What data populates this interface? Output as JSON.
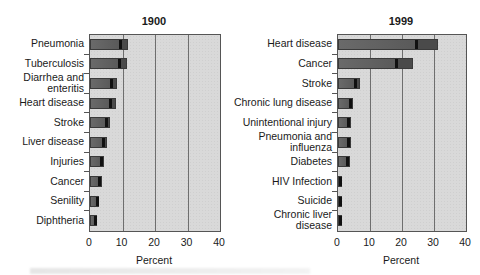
{
  "chart_data": [
    {
      "type": "bar",
      "orientation": "horizontal",
      "title": "1900",
      "xlabel": "Percent",
      "ylabel": "",
      "xlim": [
        0,
        40
      ],
      "xticks": [
        "0",
        "10",
        "20",
        "30",
        "40"
      ],
      "grid": true,
      "categories": [
        "Pneumonia",
        "Tuberculosis",
        "Diarrhea and enteritis",
        "Heart disease",
        "Stroke",
        "Liver disease",
        "Injuries",
        "Cancer",
        "Senility",
        "Diphtheria"
      ],
      "values": [
        11.8,
        11.3,
        8.3,
        8.0,
        6.2,
        5.2,
        4.2,
        3.7,
        2.9,
        2.3
      ]
    },
    {
      "type": "bar",
      "orientation": "horizontal",
      "title": "1999",
      "xlabel": "Percent",
      "ylabel": "",
      "xlim": [
        0,
        40
      ],
      "xticks": [
        "0",
        "10",
        "20",
        "30",
        "40"
      ],
      "grid": true,
      "categories": [
        "Heart disease",
        "Cancer",
        "Stroke",
        "Chronic lung disease",
        "Unintentional injury",
        "Pneumonia and influenza",
        "Diabetes",
        "HIV Infection",
        "Suicide",
        "Chronic liver disease"
      ],
      "values": [
        31.2,
        23.4,
        6.9,
        4.8,
        4.2,
        4.0,
        3.6,
        1.2,
        1.4,
        1.3
      ]
    }
  ],
  "left": {
    "title": "1900",
    "xlabel": "Percent",
    "ticks": [
      "0",
      "10",
      "20",
      "30",
      "40"
    ],
    "labels": [
      [
        "Pneumonia"
      ],
      [
        "Tuberculosis"
      ],
      [
        "Diarrhea and",
        "enteritis"
      ],
      [
        "Heart disease"
      ],
      [
        "Stroke"
      ],
      [
        "Liver disease"
      ],
      [
        "Injuries"
      ],
      [
        "Cancer"
      ],
      [
        "Senility"
      ],
      [
        "Diphtheria"
      ]
    ]
  },
  "right": {
    "title": "1999",
    "xlabel": "Percent",
    "ticks": [
      "0",
      "10",
      "20",
      "30",
      "40"
    ],
    "labels": [
      [
        "Heart disease"
      ],
      [
        "Cancer"
      ],
      [
        "Stroke"
      ],
      [
        "Chronic lung disease"
      ],
      [
        "Unintentional  injury"
      ],
      [
        "Pneumonia and",
        "influenza"
      ],
      [
        "Diabetes"
      ],
      [
        "HIV Infection"
      ],
      [
        "Suicide"
      ],
      [
        "Chronic liver",
        "disease"
      ]
    ]
  },
  "colors": {
    "plot_bg": "#d9d9d9",
    "bar": "#5e5e5e",
    "frame": "#555555"
  }
}
